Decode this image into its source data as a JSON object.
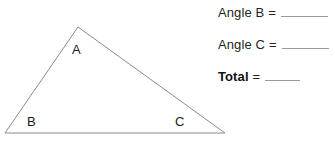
{
  "page": {
    "background_color": "#ffffff",
    "width": 335,
    "height": 143
  },
  "figure": {
    "name": "triangle-abc",
    "stroke_color": "#8a8a8a",
    "fill": "none",
    "vertices": [
      {
        "label": "A",
        "x": 78,
        "y": 27
      },
      {
        "label": "B",
        "x": 5,
        "y": 133
      },
      {
        "label": "C",
        "x": 225,
        "y": 133
      }
    ],
    "labels": {
      "a": "A",
      "b": "B",
      "c": "C"
    }
  },
  "answers": {
    "rows": [
      {
        "label": "Angle B",
        "equals": "=",
        "value": "",
        "bold": false
      },
      {
        "label": "Angle C",
        "equals": "=",
        "value": "",
        "bold": false
      },
      {
        "label": "Total",
        "equals": "=",
        "value": "",
        "bold": true
      }
    ]
  },
  "colors": {
    "text": "#1f1f1f",
    "line": "#8a8a8a",
    "blank_rule": "#9a9a9a"
  }
}
